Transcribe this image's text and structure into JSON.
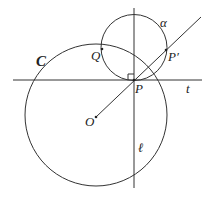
{
  "diagram": {
    "labels": {
      "circle_C": "C",
      "circle_alpha": "α",
      "point_Q": "Q",
      "point_P": "P",
      "point_P_prime": "P′",
      "point_O": "O",
      "line_t": "t",
      "line_l": "ℓ"
    },
    "stroke_color": "#333333",
    "elements": {
      "circle_C": {
        "cx": 96,
        "cy": 115,
        "r": 71
      },
      "circle_alpha": {
        "cx": 134,
        "cy": 47.5,
        "r": 33
      },
      "line_t": {
        "x1": 13,
        "y1": 80,
        "x2": 202,
        "y2": 80
      },
      "line_l": {
        "x1": 134,
        "y1": 8,
        "x2": 134,
        "y2": 188
      },
      "ray_OP": {
        "x1": 96,
        "y1": 117,
        "x2": 201,
        "y2": 17
      },
      "right_angle_marker_at_P": true
    }
  }
}
